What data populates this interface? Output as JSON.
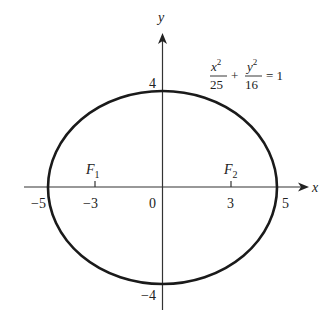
{
  "diagram": {
    "type": "ellipse-graph",
    "equation": {
      "x_num": "x",
      "x_exp": "2",
      "x_den": "25",
      "plus": "+",
      "y_num": "y",
      "y_exp": "2",
      "y_den": "16",
      "rhs": "= 1"
    },
    "axes": {
      "x_label": "x",
      "y_label": "y",
      "x_ticks": [
        {
          "value": -5,
          "label": "−5"
        },
        {
          "value": -3,
          "label": "−3"
        },
        {
          "value": 0,
          "label": "0"
        },
        {
          "value": 3,
          "label": "3"
        },
        {
          "value": 5,
          "label": "5"
        }
      ],
      "y_ticks": [
        {
          "value": 4,
          "label": "4"
        },
        {
          "value": -4,
          "label": "−4"
        }
      ]
    },
    "foci": [
      {
        "name": "F",
        "sub": "1",
        "x": -3
      },
      {
        "name": "F",
        "sub": "2",
        "x": 3
      }
    ],
    "ellipse": {
      "a": 5,
      "b": 4,
      "center": [
        0,
        0
      ]
    },
    "colors": {
      "stroke": "#1a1a1a",
      "axis": "#333333",
      "text": "#222222"
    }
  }
}
